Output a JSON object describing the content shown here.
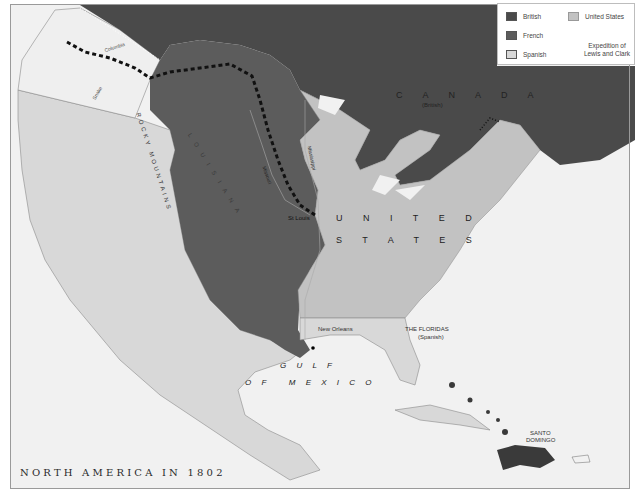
{
  "map": {
    "title": "NORTH AMERICA IN 1802",
    "colors": {
      "british": "#4a4a4a",
      "french": "#5c5c5c",
      "spanish": "#d8d8d8",
      "united_states": "#c2c2c2",
      "unclaimed": "#efefef",
      "water": "#f2f2f2"
    },
    "legend": {
      "items": [
        {
          "label": "British",
          "color": "#4a4a4a"
        },
        {
          "label": "French",
          "color": "#5c5c5c"
        },
        {
          "label": "Spanish",
          "color": "#d8d8d8"
        },
        {
          "label": "United States",
          "color": "#c2c2c2"
        }
      ],
      "expedition_label": "Expedition of Lewis and Clark"
    },
    "labels": {
      "canada": "C A N A D A",
      "canada_sub": "(British)",
      "louisiana": "L O U I S I A N A",
      "rocky_mountains": "ROCKY MOUNTAINS",
      "united": "U N I T E D",
      "states": "S T A T E S",
      "st_louis": "St Louis",
      "new_orleans": "New Orleans",
      "floridas": "THE FLORIDAS",
      "floridas_sub": "(Spanish)",
      "gulf": "G U L F",
      "of_mexico": "O F   M E X I C O",
      "santo_domingo_1": "SANTO",
      "santo_domingo_2": "DOMINGO",
      "columbia": "Columbia",
      "snake": "Snake",
      "missouri": "Missouri",
      "mississippi": "Mississippi"
    }
  }
}
